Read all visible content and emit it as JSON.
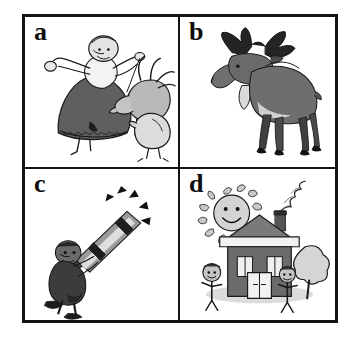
{
  "figure": {
    "type": "four-panel-grayscale-illustration-grid",
    "border_color": "#131313",
    "background_color": "#ffffff",
    "rows": 2,
    "columns": 2,
    "panels": [
      {
        "id": "a",
        "letter": "a",
        "position": "top-left",
        "subject": "woman-with-goat-and-hen",
        "description": "Cartoon line drawing of a woman in a long dark skirt and white blouse leaning back while pulling a horned goat by a rope; a hen stands at lower right.",
        "icon_name": "woman-goat-hen-illustration",
        "elements": [
          "woman",
          "dark-skirt",
          "white-blouse",
          "goat",
          "horns",
          "rope",
          "hen"
        ],
        "colors": {
          "ink": "#1a1a1a",
          "dark_fill": "#5e5e5e",
          "mid_fill": "#9a9a9a",
          "light_fill": "#d2d2d2"
        }
      },
      {
        "id": "b",
        "letter": "b",
        "position": "top-right",
        "subject": "moose",
        "description": "Shaded drawing of a bull moose standing in profile facing left, with broad palmate antlers, bell dewlap under the chin and dark slender legs.",
        "icon_name": "moose-illustration",
        "elements": [
          "antlers",
          "head",
          "dewlap",
          "body",
          "four-legs",
          "hooves",
          "tail"
        ],
        "colors": {
          "ink": "#1a1a1a",
          "antler": "#2b2b2b",
          "body": "#6e6e6e",
          "belly": "#cfcfcf",
          "legs": "#3a3a3a"
        }
      },
      {
        "id": "c",
        "letter": "c",
        "position": "bottom-left",
        "subject": "man-with-telescope",
        "description": "Cartoon of a man in a dark coat and shoes bending back while looking up through a large telescope aimed at the upper right; short black wedge rays radiate from the telescope's far end.",
        "icon_name": "telescope-observer-illustration",
        "elements": [
          "man",
          "dark-coat",
          "shoes",
          "telescope",
          "telescope-bands",
          "radiating-rays"
        ],
        "colors": {
          "ink": "#1a1a1a",
          "coat": "#3c3c3c",
          "tube": "#8f8f8f",
          "tube_highlight": "#dcdcdc",
          "rays": "#111111"
        }
      },
      {
        "id": "d",
        "letter": "d",
        "position": "bottom-right",
        "subject": "house-with-sun-tree-and-children",
        "description": "Childlike drawing of a two-storey house with a chimney emitting curling smoke, a smiling sun at upper left, a round tree at right, and two stick-figure children standing on the ground.",
        "icon_name": "house-sun-children-illustration",
        "elements": [
          "smiling-sun",
          "house",
          "roof",
          "chimney",
          "smoke",
          "windows",
          "door",
          "tree",
          "stick-figure-child-left",
          "stick-figure-child-right",
          "ground-shadow"
        ],
        "colors": {
          "ink": "#1a1a1a",
          "wall": "#6b6b6b",
          "roof": "#7a7a7a",
          "roof_band": "#f2f2f2",
          "sun": "#c9c9c9",
          "tree": "#d5d5d5",
          "ground": "#dcdcdc"
        }
      }
    ]
  }
}
